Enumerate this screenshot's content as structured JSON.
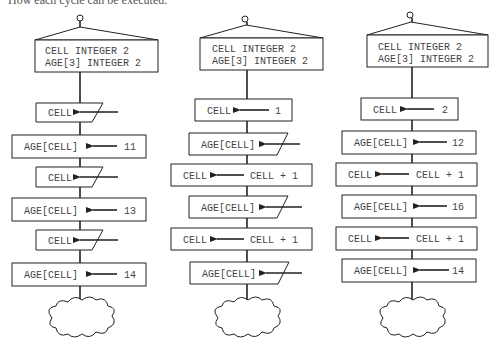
{
  "caption": "How each cycle can be executed.",
  "colors": {
    "stroke": "#222222",
    "text": "#444444",
    "background": "#ffffff"
  },
  "columns": [
    {
      "id": "col1",
      "header": {
        "line1": "CELL INTEGER 2",
        "line2": "AGE[3] INTEGER 2"
      },
      "steps": [
        {
          "type": "input",
          "target": "CELL"
        },
        {
          "type": "assign",
          "target": "AGE[CELL]",
          "value": "11"
        },
        {
          "type": "input",
          "target": "CELL"
        },
        {
          "type": "assign",
          "target": "AGE[CELL]",
          "value": "13"
        },
        {
          "type": "input",
          "target": "CELL"
        },
        {
          "type": "assign",
          "target": "AGE[CELL]",
          "value": "14"
        }
      ],
      "terminator": "cloud"
    },
    {
      "id": "col2",
      "header": {
        "line1": "CELL INTEGER 2",
        "line2": "AGE[3] INTEGER 2"
      },
      "steps": [
        {
          "type": "assign",
          "target": "CELL",
          "value": "1"
        },
        {
          "type": "input",
          "target": "AGE[CELL]"
        },
        {
          "type": "assign",
          "target": "CELL",
          "value": "CELL + 1"
        },
        {
          "type": "input",
          "target": "AGE[CELL]"
        },
        {
          "type": "assign",
          "target": "CELL",
          "value": "CELL + 1"
        },
        {
          "type": "input",
          "target": "AGE[CELL]"
        }
      ],
      "terminator": "cloud"
    },
    {
      "id": "col3",
      "header": {
        "line1": "CELL INTEGER 2",
        "line2": "AGE[3] INTEGER 2"
      },
      "steps": [
        {
          "type": "assign",
          "target": "CELL",
          "value": "2"
        },
        {
          "type": "assign",
          "target": "AGE[CELL]",
          "value": "12"
        },
        {
          "type": "assign",
          "target": "CELL",
          "value": "CELL + 1"
        },
        {
          "type": "assign",
          "target": "AGE[CELL]",
          "value": "16"
        },
        {
          "type": "assign",
          "target": "CELL",
          "value": "CELL + 1"
        },
        {
          "type": "assign",
          "target": "AGE[CELL]",
          "value": "14"
        }
      ],
      "terminator": "cloud"
    }
  ]
}
